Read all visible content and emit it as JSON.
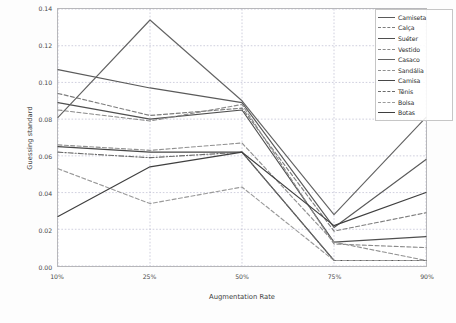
{
  "chart_data": {
    "type": "line",
    "title": "",
    "xlabel": "Augmentation Rate",
    "ylabel": "Guessing standard",
    "categories": [
      "10%",
      "25%",
      "50%",
      "75%",
      "90%"
    ],
    "x_tick_labels": [
      "10%",
      "25%",
      "50%",
      "75%",
      "90%"
    ],
    "y_tick_labels": [
      "0.00",
      "0.02",
      "0.04",
      "0.06",
      "0.08",
      "0.10",
      "0.12",
      "0.14"
    ],
    "y_ticks": [
      0.0,
      0.02,
      0.04,
      0.06,
      0.08,
      0.1,
      0.12,
      0.14
    ],
    "ylim": [
      0.0,
      0.14
    ],
    "grid": true,
    "grid_style": "dotted",
    "legend_position": "upper right",
    "series": [
      {
        "name": "Camiseta",
        "style": "solid",
        "color": "#5a5a5a",
        "values": [
          0.107,
          0.097,
          0.089,
          0.021,
          0.058
        ]
      },
      {
        "name": "Calça",
        "style": "dashed",
        "color": "#7d7d7d",
        "values": [
          0.094,
          0.082,
          0.086,
          0.019,
          0.029
        ]
      },
      {
        "name": "Suéter",
        "style": "solid",
        "color": "#4f4f4f",
        "values": [
          0.089,
          0.08,
          0.085,
          0.013,
          0.016
        ]
      },
      {
        "name": "Vestido",
        "style": "dashed",
        "color": "#8a8a8a",
        "values": [
          0.085,
          0.079,
          0.088,
          0.012,
          0.01
        ]
      },
      {
        "name": "Casaco",
        "style": "solid",
        "color": "#636363",
        "values": [
          0.081,
          0.134,
          0.09,
          0.028,
          0.081
        ]
      },
      {
        "name": "Sandália",
        "style": "dashed",
        "color": "#909090",
        "values": [
          0.066,
          0.063,
          0.067,
          0.013,
          0.003
        ]
      },
      {
        "name": "Camisa",
        "style": "solid",
        "color": "#474747",
        "values": [
          0.065,
          0.062,
          0.062,
          0.003,
          0.003
        ]
      },
      {
        "name": "Tênis",
        "style": "dashdot",
        "color": "#6b6b6b",
        "values": [
          0.062,
          0.059,
          0.062,
          0.003,
          0.003
        ]
      },
      {
        "name": "Bolsa",
        "style": "dashed",
        "color": "#9a9a9a",
        "values": [
          0.053,
          0.034,
          0.043,
          0.003,
          0.003
        ]
      },
      {
        "name": "Botas",
        "style": "solid",
        "color": "#3f3f3f",
        "values": [
          0.027,
          0.054,
          0.062,
          0.022,
          0.04
        ]
      }
    ]
  },
  "legend": {
    "items": [
      {
        "label": "Camiseta"
      },
      {
        "label": "Calça"
      },
      {
        "label": "Suéter"
      },
      {
        "label": "Vestido"
      },
      {
        "label": "Casaco"
      },
      {
        "label": "Sandália"
      },
      {
        "label": "Camisa"
      },
      {
        "label": "Tênis"
      },
      {
        "label": "Bolsa"
      },
      {
        "label": "Botas"
      }
    ]
  },
  "colors": {
    "axis": "#b9b9b9",
    "grid": "#b0b0c8",
    "text": "#3c3c3c",
    "background": "#ffffff"
  }
}
